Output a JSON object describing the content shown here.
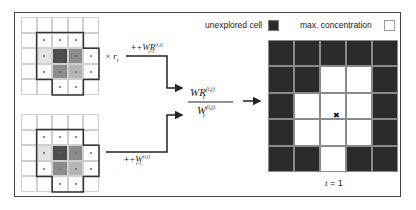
{
  "colors": {
    "frame": "#444444",
    "unexplored": "#2b2b2b",
    "max_concentration": "#ffffff",
    "gray_dark": "#4d4d4d",
    "gray_mid": "#8c8c8c",
    "gray_light": "#b5b5b5",
    "gray_faint": "#e2e2e2"
  },
  "left_top_grid": {
    "label": "× r_t",
    "cells": [
      [
        "w",
        "w",
        "w",
        "w",
        "w"
      ],
      [
        "w",
        "p",
        "p",
        "p",
        "w"
      ],
      [
        "w",
        "f",
        "d",
        "m",
        "p"
      ],
      [
        "w",
        "p",
        "m",
        "l",
        "p"
      ],
      [
        "w",
        "w",
        "p",
        "p",
        "w"
      ]
    ]
  },
  "left_bottom_grid": {
    "cells": [
      [
        "w",
        "w",
        "w",
        "w",
        "w"
      ],
      [
        "w",
        "p",
        "p",
        "p",
        "w"
      ],
      [
        "w",
        "f",
        "d",
        "m",
        "p"
      ],
      [
        "w",
        "p",
        "m",
        "l",
        "p"
      ],
      [
        "w",
        "w",
        "p",
        "p",
        "w"
      ]
    ]
  },
  "arrows": {
    "top_label_main": "+WR",
    "top_label_sup": "(i,j)",
    "top_label_sub": "t-1",
    "bottom_label_main": "+W",
    "bottom_label_sup": "(i,j)",
    "bottom_label_sub": "t-1",
    "times_label": "× r",
    "times_sub": "t"
  },
  "fraction": {
    "numerator_main": "WR",
    "numerator_sup": "(i,j)",
    "numerator_sub": "t",
    "denominator_main": "W",
    "denominator_sup": "(i,j)",
    "denominator_sub": "t"
  },
  "legend": {
    "unexplored_label": "unexplored cell",
    "max_label": "max. concentration"
  },
  "right_grid": {
    "cells": [
      [
        "u",
        "u",
        "u",
        "u",
        "u"
      ],
      [
        "u",
        "u",
        "e",
        "e",
        "u"
      ],
      [
        "u",
        "e",
        "e",
        "e",
        "u"
      ],
      [
        "u",
        "e",
        "e",
        "e",
        "u"
      ],
      [
        "u",
        "u",
        "e",
        "u",
        "u"
      ]
    ],
    "marker": "✖",
    "caption_var": "t",
    "caption_rest": " = 1"
  }
}
